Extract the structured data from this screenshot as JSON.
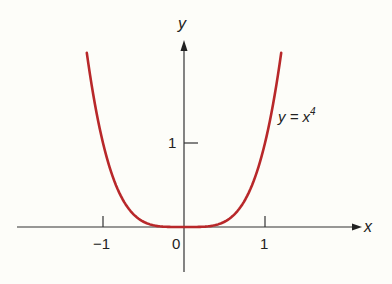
{
  "chart_data": {
    "type": "line",
    "title": "",
    "function": "y = x^4",
    "xlabel": "x",
    "ylabel": "y",
    "xlim": [
      -2.07,
      2.2
    ],
    "ylim": [
      -0.54,
      2.3
    ],
    "x_ticks": [
      -1,
      0,
      1
    ],
    "x_tick_labels": [
      "−1",
      "0",
      "1"
    ],
    "y_ticks": [
      1
    ],
    "y_tick_labels": [
      "1"
    ],
    "grid": false,
    "series": [
      {
        "name": "y = x^4",
        "color": "#b8282a",
        "domain": [
          -1.2,
          1.2
        ],
        "x": [
          -1.2,
          -1.1,
          -1.0,
          -0.9,
          -0.8,
          -0.7,
          -0.6,
          -0.5,
          -0.4,
          -0.3,
          -0.2,
          -0.1,
          0,
          0.1,
          0.2,
          0.3,
          0.4,
          0.5,
          0.6,
          0.7,
          0.8,
          0.9,
          1.0,
          1.1,
          1.2
        ],
        "y": [
          2.0736,
          1.4641,
          1.0,
          0.6561,
          0.4096,
          0.2401,
          0.1296,
          0.0625,
          0.0256,
          0.0081,
          0.0016,
          0.0001,
          0,
          0.0001,
          0.0016,
          0.0081,
          0.0256,
          0.0625,
          0.1296,
          0.2401,
          0.4096,
          0.6561,
          1.0,
          1.4641,
          2.0736
        ]
      }
    ],
    "annotations": [
      {
        "text": "y = x4",
        "display": {
          "base": "y = x",
          "exp": "4"
        },
        "x": 1.15,
        "y": 1.3
      }
    ]
  },
  "labels": {
    "x_axis": "x",
    "y_axis": "y",
    "curve_base": "y = x",
    "curve_exp": "4",
    "tick_neg1": "−1",
    "tick_0": "0",
    "tick_pos1": "1",
    "tick_y1": "1"
  },
  "colors": {
    "curve": "#b8282a",
    "axis": "#333333",
    "background": "#fdfdf9"
  }
}
